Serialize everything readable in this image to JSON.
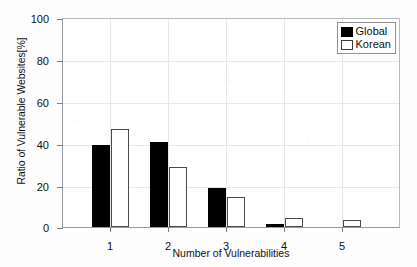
{
  "chart_data": {
    "type": "bar",
    "title": "",
    "xlabel": "Number of Vulnerabilities",
    "ylabel": "Ratio of Vulnerable Websites[%]",
    "categories": [
      "1",
      "2",
      "3",
      "4",
      "5"
    ],
    "xtick_labels": [
      "1",
      "2",
      "3",
      "4",
      "5"
    ],
    "ytick_labels": [
      "0",
      "20",
      "40",
      "60",
      "80",
      "100"
    ],
    "yticks": [
      0,
      20,
      40,
      60,
      80,
      100
    ],
    "ylim": [
      0,
      100
    ],
    "grid": true,
    "legend_position": "top-right",
    "series": [
      {
        "name": "Global",
        "color": "#000000",
        "fill": "solid",
        "values": [
          39.0,
          40.5,
          18.5,
          1.2,
          0.0
        ]
      },
      {
        "name": "Korean",
        "color": "#ffffff",
        "fill": "open",
        "values": [
          46.5,
          28.5,
          14.3,
          4.5,
          3.4
        ]
      }
    ]
  },
  "legend": {
    "entries": [
      {
        "label": "Global",
        "swatch": "filled-black-square"
      },
      {
        "label": "Korean",
        "swatch": "open-white-square"
      }
    ]
  },
  "colors": {
    "global_bar": "#000000",
    "korean_bar": "#ffffff",
    "korean_bar_edge": "#4a4a4a",
    "axis": "#9a9a9a",
    "grid": "#e7e7e7",
    "background": "#ffffff",
    "text": "#111111"
  }
}
